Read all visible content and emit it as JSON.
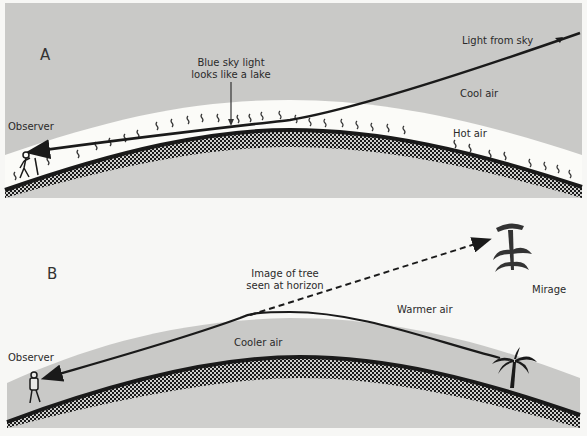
{
  "panels": [
    {
      "id": "A",
      "letter": "A",
      "labels": {
        "observer": "Observer",
        "blue_sky_line1": "Blue sky light",
        "blue_sky_line2": "looks like a lake",
        "light_from_sky": "Light from sky",
        "cool_air": "Cool air",
        "hot_air": "Hot air"
      }
    },
    {
      "id": "B",
      "letter": "B",
      "labels": {
        "observer": "Observer",
        "image_line1": "Image of tree",
        "image_line2": "seen at horizon",
        "warmer_air": "Warmer air",
        "cooler_air": "Cooler air",
        "mirage": "Mirage"
      }
    }
  ],
  "colors": {
    "sky_gray": "#c9c9c7",
    "hot_air_white": "#fbfbf8",
    "ground_gray": "#cfcfcd",
    "ink": "#1a1a1a",
    "page": "#f7f7f5"
  }
}
